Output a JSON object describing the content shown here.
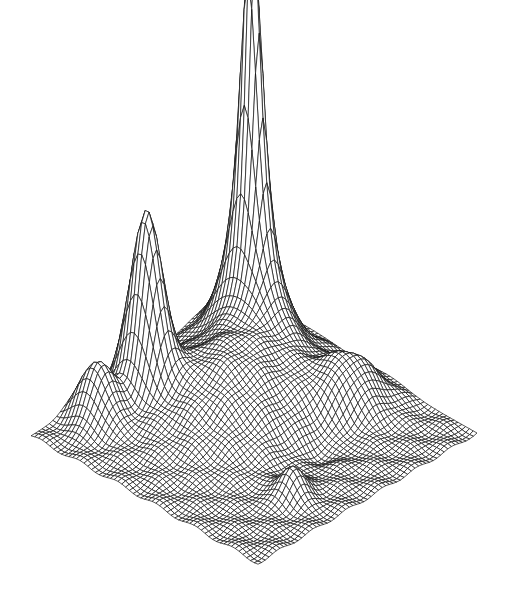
{
  "figure": {
    "background": "#ffffff",
    "line_color": "#111111",
    "fill_color": "#ffffff"
  },
  "chart_data": {
    "type": "surface",
    "title": "",
    "subtitle": "",
    "xlabel": "",
    "ylabel": "",
    "zlabel": "",
    "grid": true,
    "legend": "none",
    "style": "black wireframe mesh, hidden-line removed, isometric view",
    "mesh_resolution": [
      60,
      60
    ],
    "domain": {
      "x": [
        0,
        1
      ],
      "y": [
        0,
        1
      ]
    },
    "projection": {
      "left_corner_px": [
        31,
        436
      ],
      "front_corner_px": [
        258,
        563
      ],
      "right_corner_px": [
        477,
        433
      ],
      "z_scale_px": 430
    },
    "components": [
      {
        "name": "main-peak",
        "x": 0.2,
        "y": 0.2,
        "height": 1.0,
        "sx": 0.035,
        "sy": 0.05,
        "kind": "sharp"
      },
      {
        "name": "second-peak",
        "x": 0.62,
        "y": 0.14,
        "height": 0.4,
        "sx": 0.045,
        "sy": 0.06,
        "kind": "gauss"
      },
      {
        "name": "left-hump",
        "x": 0.8,
        "y": 0.1,
        "height": 0.13,
        "sx": 0.05,
        "sy": 0.06,
        "kind": "gauss"
      },
      {
        "name": "broad-rise",
        "x": 0.45,
        "y": 0.35,
        "height": 0.14,
        "sx": 0.2,
        "sy": 0.18,
        "kind": "gauss"
      },
      {
        "name": "right-hump",
        "x": 0.18,
        "y": 0.62,
        "height": 0.1,
        "sx": 0.09,
        "sy": 0.08,
        "kind": "gauss"
      },
      {
        "name": "front-bump",
        "x": 0.66,
        "y": 0.82,
        "height": 0.07,
        "sx": 0.04,
        "sy": 0.04,
        "kind": "gauss"
      },
      {
        "name": "trough",
        "x": 0.4,
        "y": 0.7,
        "height": -0.035,
        "sx": 0.12,
        "sy": 0.06,
        "kind": "gauss"
      }
    ],
    "annotations": []
  }
}
